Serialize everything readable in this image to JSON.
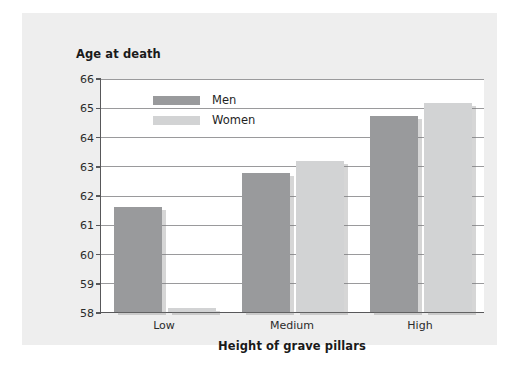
{
  "chart_data": {
    "type": "bar",
    "title": "",
    "ylabel": "Age at death",
    "xlabel": "Height of grave pillars",
    "categories": [
      "Low",
      "Medium",
      "High"
    ],
    "series": [
      {
        "name": "Men",
        "color": "#999a9c",
        "values": [
          61.6,
          62.75,
          64.7
        ]
      },
      {
        "name": "Women",
        "color": "#d2d3d4",
        "values": [
          58.15,
          63.15,
          65.15
        ]
      }
    ],
    "ylim": [
      58,
      66
    ],
    "yticks": [
      58,
      59,
      60,
      61,
      62,
      63,
      64,
      65,
      66
    ],
    "ytick_labels": [
      "58",
      "59",
      "60",
      "61",
      "62",
      "63",
      "64",
      "65",
      "66"
    ],
    "grid": true,
    "legend_position": "top-left-inside"
  },
  "figure": {
    "background_color": "#eeeeee",
    "plot_background_color": "#ffffff",
    "axis_color": "#58585a",
    "gridline_color": "#9a9a9c"
  },
  "legend": {
    "items": [
      {
        "label": "Men",
        "color": "#999a9c"
      },
      {
        "label": "Women",
        "color": "#d2d3d4"
      }
    ]
  }
}
